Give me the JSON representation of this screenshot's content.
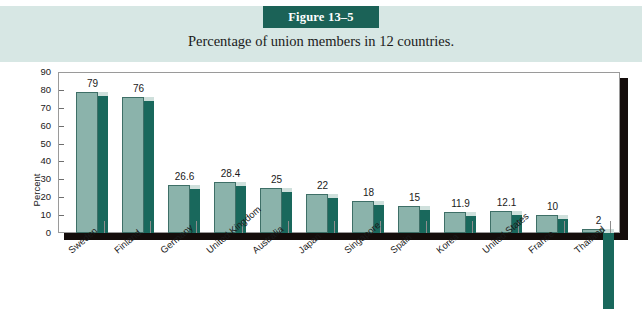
{
  "figure": {
    "badge_label": "Figure 13–5",
    "caption": "Percentage of union members in 12 countries.",
    "badge_color": "#1b6257",
    "band_color": "#d7e7e4"
  },
  "chart_data": {
    "type": "bar",
    "title": "Percentage of union members in 12 countries.",
    "xlabel": "",
    "ylabel": "Percent",
    "ylim": [
      0,
      90
    ],
    "ytick_step": 10,
    "yticks": [
      "90",
      "80",
      "70",
      "60",
      "50",
      "40",
      "30",
      "20",
      "10",
      "0"
    ],
    "grid": false,
    "legend": "none",
    "bar_style": "3d",
    "bar_front_color": "#8bb3ab",
    "bar_side_color": "#19685c",
    "categories": [
      "Sweden",
      "Finland",
      "Germany",
      "United Kingdom",
      "Australia",
      "Japan",
      "Singapore",
      "Spain",
      "Korea",
      "United States",
      "France",
      "Thailand"
    ],
    "values": [
      79,
      76,
      26.6,
      28.4,
      25,
      22,
      18,
      15,
      11.9,
      12.1,
      10,
      2
    ],
    "value_labels": [
      "79",
      "76",
      "26.6",
      "28.4",
      "25",
      "22",
      "18",
      "15",
      "11.9",
      "12.1",
      "10",
      "2"
    ]
  }
}
